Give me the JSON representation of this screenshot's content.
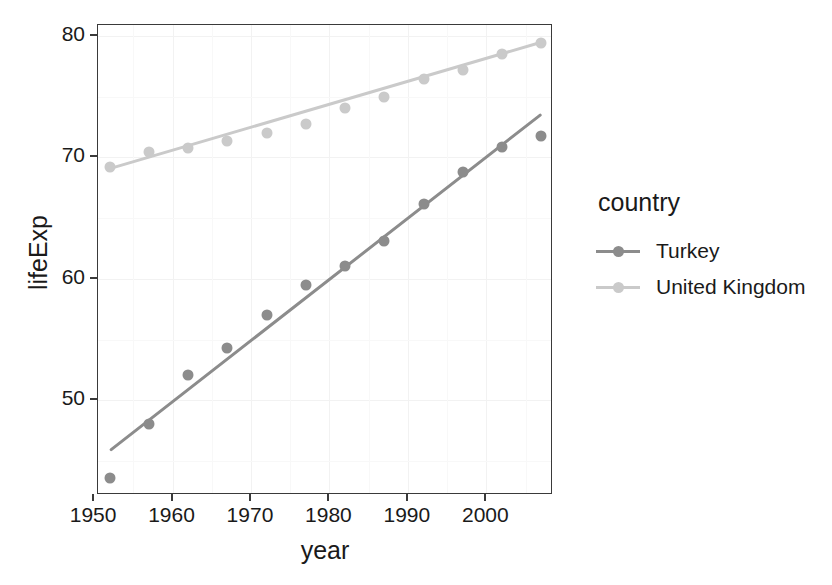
{
  "chart_data": {
    "type": "scatter",
    "title": "",
    "xlabel": "year",
    "ylabel": "lifeExp",
    "xlim": [
      1950.5,
      2008.5
    ],
    "ylim": [
      42.2,
      80.9
    ],
    "x_ticks": [
      1950,
      1960,
      1970,
      1980,
      1990,
      2000
    ],
    "y_ticks": [
      50,
      60,
      70,
      80
    ],
    "grid": true,
    "legend": {
      "title": "country",
      "position": "right",
      "entries": [
        {
          "name": "Turkey",
          "color": "#8c8c8c"
        },
        {
          "name": "United Kingdom",
          "color": "#cacaca"
        }
      ]
    },
    "x": [
      1952,
      1957,
      1962,
      1967,
      1972,
      1977,
      1982,
      1987,
      1992,
      1997,
      2002,
      2007
    ],
    "series": [
      {
        "name": "Turkey",
        "color": "#8c8c8c",
        "values": [
          43.585,
          48.079,
          52.098,
          54.336,
          57.005,
          59.507,
          61.036,
          63.108,
          66.146,
          68.835,
          70.845,
          71.777
        ],
        "trend": {
          "x0": 1952,
          "y0": 45.9,
          "x1": 2007,
          "y1": 73.6
        }
      },
      {
        "name": "United Kingdom",
        "color": "#cacaca",
        "values": [
          69.18,
          70.42,
          70.76,
          71.36,
          72.01,
          72.76,
          74.04,
          75.007,
          76.42,
          77.218,
          78.471,
          79.425
        ],
        "trend": {
          "x0": 1952,
          "y0": 69.1,
          "x1": 2007,
          "y1": 79.5
        }
      }
    ]
  },
  "axis": {
    "y_tick_labels": [
      "50",
      "60",
      "70",
      "80"
    ],
    "x_tick_labels": [
      "1950",
      "1960",
      "1970",
      "1980",
      "1990",
      "2000"
    ],
    "y_title": "lifeExp",
    "x_title": "year"
  },
  "legend": {
    "title": "country",
    "items": [
      {
        "label": "Turkey"
      },
      {
        "label": "United Kingdom"
      }
    ]
  }
}
